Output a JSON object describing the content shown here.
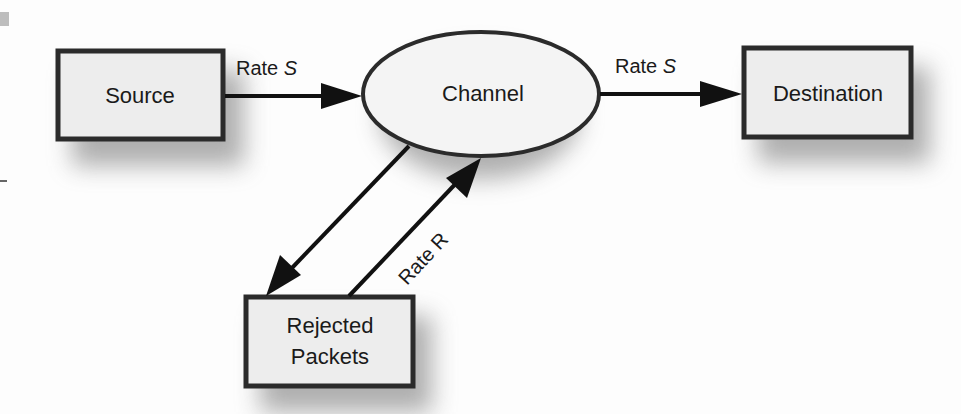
{
  "diagram": {
    "type": "flow-diagram",
    "nodes": {
      "source": {
        "label": "Source",
        "shape": "rectangle"
      },
      "channel": {
        "label": "Channel",
        "shape": "ellipse"
      },
      "destination": {
        "label": "Destination",
        "shape": "rectangle"
      },
      "rejected": {
        "label_line1": "Rejected",
        "label_line2": "Packets",
        "shape": "rectangle"
      }
    },
    "edges": [
      {
        "from": "Source",
        "to": "Channel",
        "label_prefix": "Rate ",
        "label_var": "S"
      },
      {
        "from": "Channel",
        "to": "Destination",
        "label_prefix": "Rate ",
        "label_var": "S"
      },
      {
        "from": "Channel",
        "to": "Rejected Packets",
        "label_prefix": "",
        "label_var": ""
      },
      {
        "from": "Rejected Packets",
        "to": "Channel",
        "label_prefix": "Rate R",
        "label_var": ""
      }
    ],
    "colors": {
      "box_fill": "#ededed",
      "stroke": "#2b2b2b",
      "arrow": "#111111",
      "shadow": "#808080"
    }
  }
}
